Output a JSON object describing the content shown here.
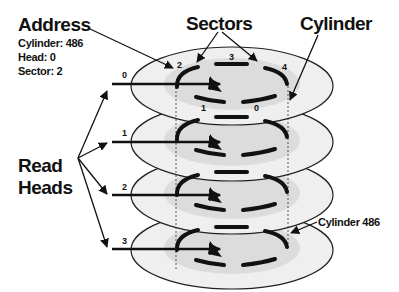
{
  "title_labels": {
    "address": "Address",
    "sectors": "Sectors",
    "cylinder": "Cylinder",
    "read_heads_line1": "Read",
    "read_heads_line2": "Heads",
    "cylinder_callout": "Cylinder 486"
  },
  "address_details": {
    "cylinder": "Cylinder: 486",
    "head": "Head: 0",
    "sector": "Sector: 2"
  },
  "heads": [
    "0",
    "1",
    "2",
    "3"
  ],
  "sector_numbers": {
    "s0": "0",
    "s1": "1",
    "s2": "2",
    "s3": "3",
    "s4": "4"
  },
  "colors": {
    "platter_fill": "#efefef",
    "track_fill": "#dcdcdc",
    "ink": "#111111"
  }
}
